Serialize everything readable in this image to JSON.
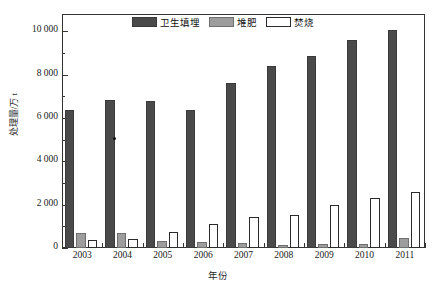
{
  "chart_data": {
    "type": "bar",
    "title": "",
    "xlabel": "年份",
    "ylabel": "处理量/万 t",
    "categories": [
      "2003",
      "2004",
      "2005",
      "2006",
      "2007",
      "2008",
      "2009",
      "2010",
      "2011"
    ],
    "ylim": [
      0,
      10800
    ],
    "yticks": [
      0,
      2000,
      4000,
      6000,
      8000,
      10000
    ],
    "ytick_labels": [
      "0",
      "2 000",
      "4 000",
      "6 000",
      "8 000",
      "10 000"
    ],
    "yminor_ticks": [
      1000,
      3000,
      5000,
      7000,
      9000
    ],
    "grid": false,
    "legend_position": "top-center",
    "series": [
      {
        "name": "卫生填埋",
        "color": "#4a4a4a",
        "values": [
          6350,
          6830,
          6800,
          6380,
          7620,
          8420,
          8880,
          9620,
          10050
        ]
      },
      {
        "name": "堆肥",
        "color": "#9d9d9d",
        "values": [
          700,
          690,
          340,
          290,
          250,
          160,
          180,
          190,
          450
        ]
      },
      {
        "name": "焚烧",
        "color": "#ffffff",
        "values": [
          350,
          420,
          760,
          1130,
          1420,
          1540,
          2000,
          2300,
          2600
        ]
      }
    ]
  }
}
